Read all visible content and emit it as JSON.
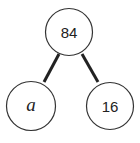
{
  "diagram": {
    "type": "number-bond",
    "root": {
      "label": "84"
    },
    "children": [
      {
        "label": "a",
        "italic": true
      },
      {
        "label": "16"
      }
    ],
    "colors": {
      "stroke": "#222222",
      "background": "#ffffff"
    }
  }
}
